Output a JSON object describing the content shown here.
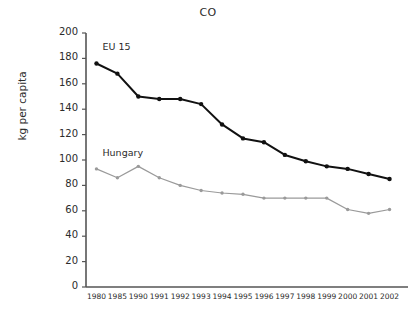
{
  "chart_data": {
    "type": "line",
    "title": "CO",
    "xlabel": "",
    "ylabel": "kg per capita",
    "ylim": [
      0,
      200
    ],
    "ytick_step": 20,
    "yticks": [
      0,
      20,
      40,
      60,
      80,
      100,
      120,
      140,
      160,
      180,
      200
    ],
    "grid": false,
    "legend_position": "inline-annotation",
    "categories": [
      "1980",
      "1985",
      "1990",
      "1991",
      "1992",
      "1993",
      "1994",
      "1995",
      "1996",
      "1997",
      "1998",
      "1999",
      "2000",
      "2001",
      "2002"
    ],
    "series": [
      {
        "name": "EU 15",
        "color": "#111111",
        "marker": "circle",
        "values": [
          176,
          168,
          150,
          148,
          148,
          144,
          128,
          117,
          114,
          104,
          99,
          95,
          93,
          89,
          85
        ]
      },
      {
        "name": "Hungary",
        "color": "#9a9a9a",
        "marker": "circle",
        "values": [
          93,
          86,
          95,
          86,
          80,
          76,
          74,
          73,
          70,
          70,
          70,
          70,
          61,
          58,
          61
        ]
      }
    ],
    "annotations": [
      {
        "text": "EU 15",
        "series": "EU 15"
      },
      {
        "text": "Hungary",
        "series": "Hungary"
      }
    ]
  },
  "axis": {
    "y_axis_color": "#555555",
    "x_axis_color": "#555555"
  }
}
